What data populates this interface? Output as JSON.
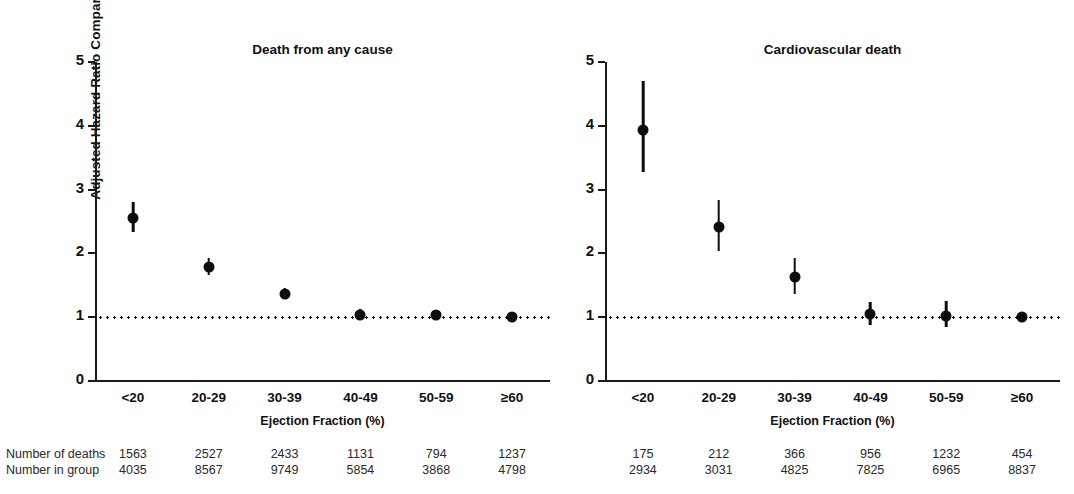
{
  "figure": {
    "ylabel": "Adjusted Hazard Ratio Compared to EF  ≥ 60% (Mortality)",
    "xaxis_title": "Ejection Fraction (%)",
    "row_labels": {
      "deaths": "Number of deaths",
      "group": "Number in group"
    },
    "colors": {
      "ink": "#0d0d0d",
      "axis": "#1a1a1a",
      "background": "#ffffff"
    }
  },
  "chart_data": [
    {
      "type": "scatter",
      "title": "Death from any cause",
      "xlabel": "Ejection Fraction (%)",
      "ylabel": "Adjusted Hazard Ratio Compared to EF ≥ 60% (Mortality)",
      "categories": [
        "<20",
        "20-29",
        "30-39",
        "40-49",
        "50-59",
        "≥60"
      ],
      "values": [
        2.56,
        1.79,
        1.37,
        1.04,
        1.03,
        1.0
      ],
      "ci_low": [
        2.33,
        1.66,
        1.28,
        0.96,
        0.95,
        1.0
      ],
      "ci_high": [
        2.8,
        1.93,
        1.46,
        1.13,
        1.12,
        1.0
      ],
      "ylim": [
        0,
        5
      ],
      "yticks": [
        0,
        1,
        2,
        3,
        4,
        5
      ],
      "grid": false,
      "reference_line": 1,
      "legend": "none",
      "number_of_deaths": [
        1563,
        2527,
        2433,
        1131,
        794,
        1237
      ],
      "number_in_group": [
        4035,
        8567,
        9749,
        5854,
        3868,
        4798
      ]
    },
    {
      "type": "scatter",
      "title": "Cardiovascular death",
      "xlabel": "Ejection Fraction (%)",
      "ylabel": "Adjusted Hazard Ratio Compared to EF ≥ 60% (Mortality)",
      "categories": [
        "<20",
        "20-29",
        "30-39",
        "40-49",
        "50-59",
        "≥60"
      ],
      "values": [
        3.94,
        2.42,
        1.63,
        1.05,
        1.02,
        1.0
      ],
      "ci_low": [
        3.28,
        2.04,
        1.36,
        0.88,
        0.84,
        1.0
      ],
      "ci_high": [
        4.7,
        2.83,
        1.93,
        1.24,
        1.25,
        1.0
      ],
      "ylim": [
        0,
        5
      ],
      "yticks": [
        0,
        1,
        2,
        3,
        4,
        5
      ],
      "grid": false,
      "reference_line": 1,
      "legend": "none",
      "number_of_deaths": [
        175,
        212,
        366,
        956,
        1232,
        454
      ],
      "number_in_group": [
        2934,
        3031,
        4825,
        7825,
        6965,
        8837
      ]
    }
  ]
}
